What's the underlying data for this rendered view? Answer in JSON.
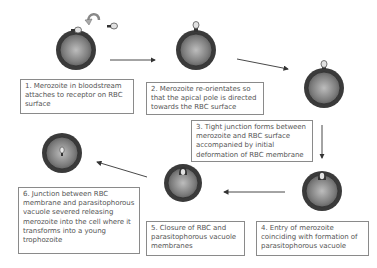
{
  "diagram": {
    "colors": {
      "cell_outer": "#3e3e3e",
      "cell_inner_light": "#b9b9b9",
      "cell_inner_dark": "#6a6a6a",
      "merozoite": "#d8d8d8",
      "arrow": "#333333",
      "box_border": "#8a8a8a",
      "text": "#555555"
    },
    "steps": [
      {
        "number": 1,
        "text": "1. Merozoite in bloodstream attaches to receptor on RBC surface"
      },
      {
        "number": 2,
        "text": "2. Merozoite re-orientates so that the apical pole is directed towards the RBC surface"
      },
      {
        "number": 3,
        "text": "3. Tight junction forms between merozoite and RBC surface accompanied by initial deformation of RBC membrane"
      },
      {
        "number": 4,
        "text": "4. Entry of merozoite coinciding with formation of parasitophorous vacuole"
      },
      {
        "number": 5,
        "text": "5. Closure of RBC and parasitophorous vacuole membranes"
      },
      {
        "number": 6,
        "text": "6. Junction between RBC membrane and parasitophorous vacuole severed releasing merozoite into the cell where it transforms into a young trophozoite"
      }
    ],
    "flow": [
      "1→2",
      "2→3",
      "3→4",
      "4→5",
      "5→6"
    ]
  }
}
